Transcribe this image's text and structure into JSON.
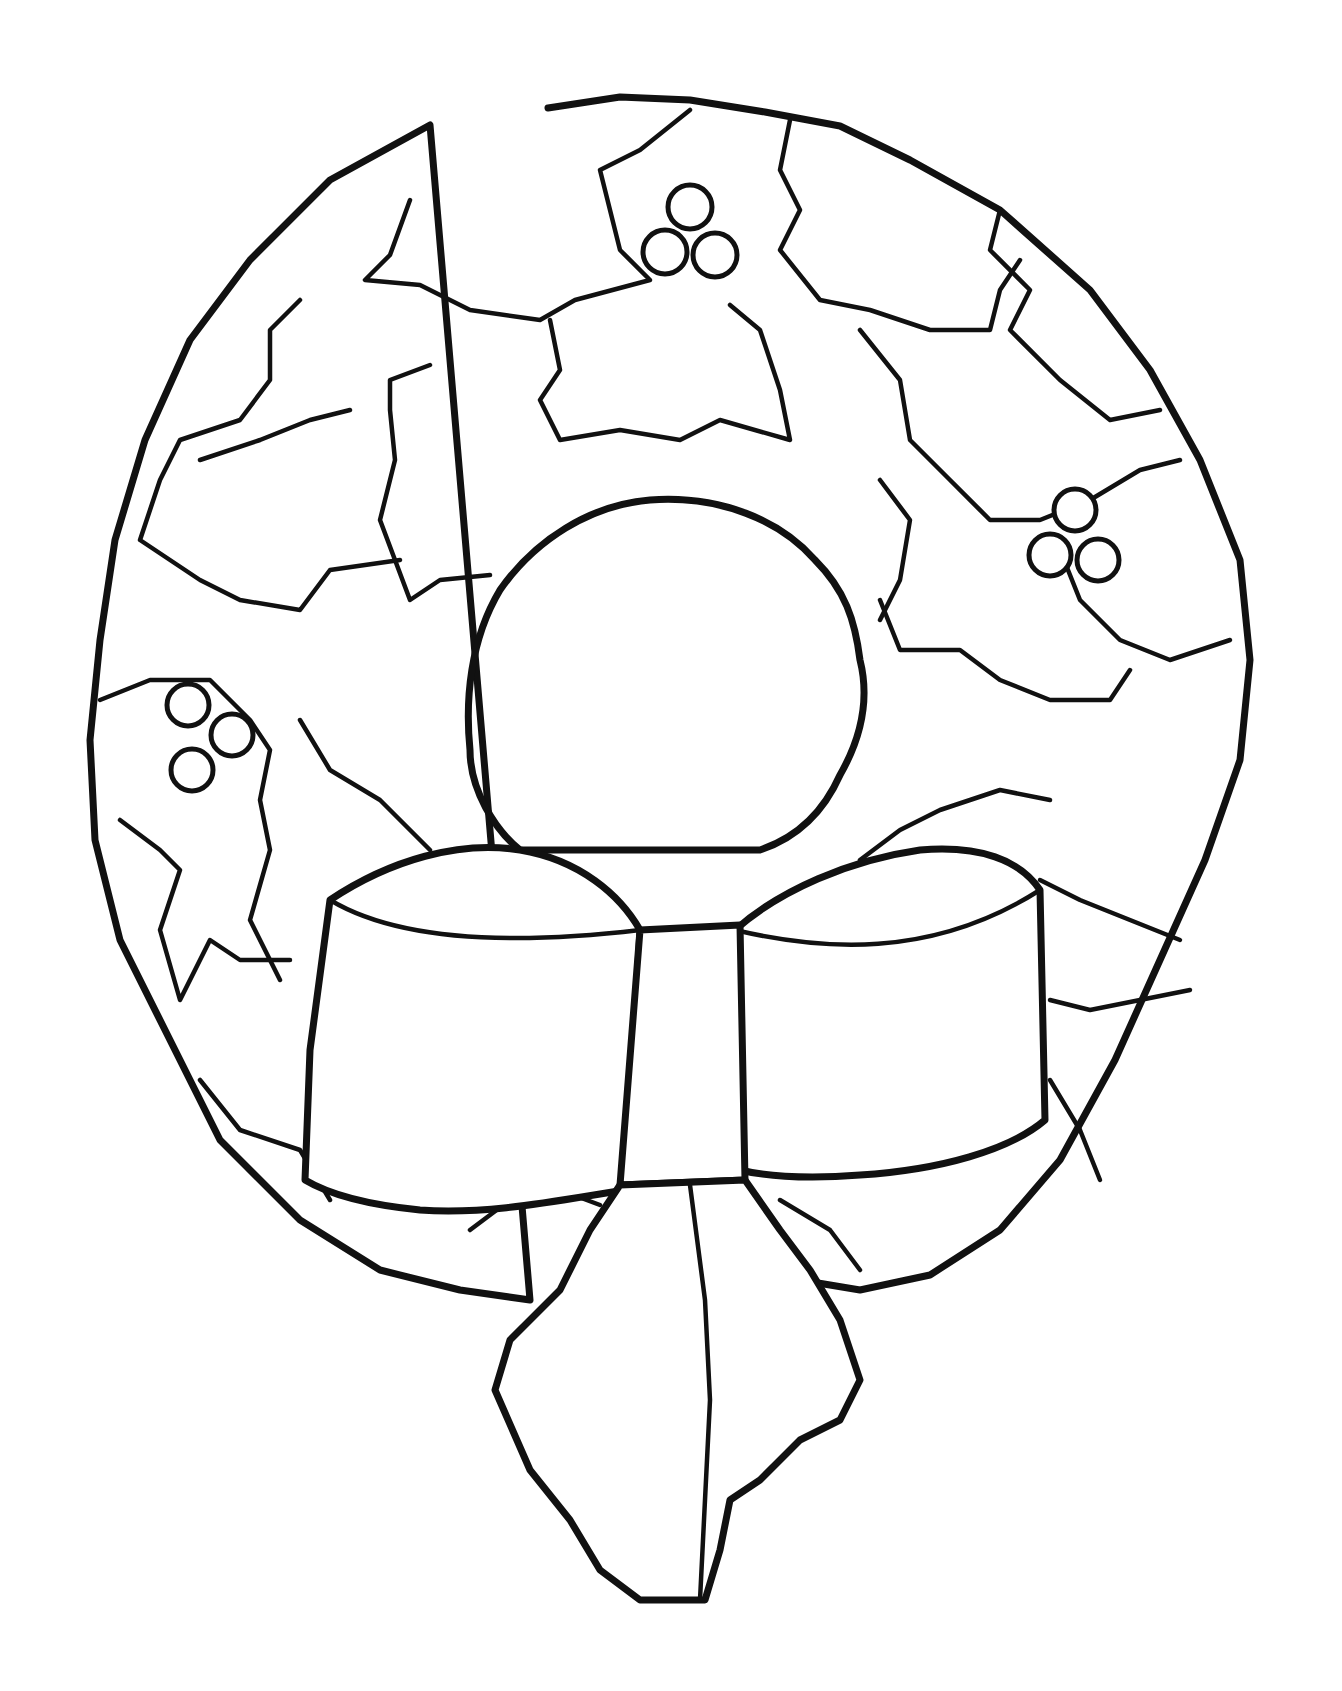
{
  "page": {
    "background": "#ffffff",
    "line_color": "#111111"
  },
  "artwork": {
    "elements": [
      "wreath-ring",
      "holly-leaves",
      "berry-cluster-top",
      "berry-cluster-right",
      "berry-cluster-left",
      "bow",
      "bow-knot",
      "bow-tail"
    ]
  }
}
